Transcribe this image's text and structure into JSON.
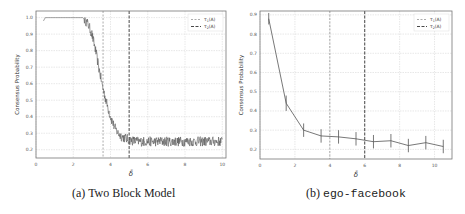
{
  "chart_data": [
    {
      "type": "line",
      "panel": "a",
      "caption_prefix": "(a)",
      "caption": "Two Block Model",
      "xlabel": "δ̄",
      "ylabel": "Consensus Probability",
      "xlim": [
        0,
        10.2
      ],
      "ylim": [
        0.15,
        1.04
      ],
      "xticks": [
        0,
        2,
        4,
        6,
        8,
        10
      ],
      "yticks": [
        0.2,
        0.3,
        0.4,
        0.5,
        0.6,
        0.7,
        0.8,
        0.9,
        1.0
      ],
      "grid": true,
      "legend": {
        "position": "upper right",
        "entries": [
          "τ1(A)",
          "τ2(A)"
        ]
      },
      "vlines": [
        {
          "name": "τ1(A)",
          "x": 3.6,
          "style": "dashed-light"
        },
        {
          "name": "τ2(A)",
          "x": 5.0,
          "style": "dashed-dark"
        }
      ],
      "series": [
        {
          "name": "consensus probability",
          "x": [
            0.4,
            0.5,
            0.6,
            1.0,
            1.5,
            2.0,
            2.5,
            2.6,
            2.8,
            3.0,
            3.2,
            3.4,
            3.6,
            3.8,
            4.0,
            4.2,
            4.4,
            4.6,
            4.8,
            5.0,
            5.2,
            5.5,
            6.0,
            6.5,
            7.0,
            7.5,
            8.0,
            8.5,
            9.0,
            9.5,
            10.0
          ],
          "values": [
            0.98,
            1.0,
            1.0,
            1.0,
            1.0,
            1.0,
            1.0,
            0.99,
            0.96,
            0.9,
            0.8,
            0.68,
            0.57,
            0.48,
            0.4,
            0.34,
            0.3,
            0.28,
            0.27,
            0.26,
            0.255,
            0.25,
            0.25,
            0.25,
            0.25,
            0.25,
            0.25,
            0.25,
            0.25,
            0.25,
            0.25
          ],
          "noise": "high-frequency fluctuation ±0.03 after x≈2.6"
        }
      ]
    },
    {
      "type": "line",
      "panel": "b",
      "caption_prefix": "(b)",
      "caption": "ego-facebook",
      "xlabel": "δ̄",
      "ylabel": "Consensus Probability",
      "xlim": [
        0,
        11
      ],
      "ylim": [
        0.15,
        0.92
      ],
      "xticks": [
        0,
        2,
        4,
        6,
        8,
        10
      ],
      "yticks": [
        0.2,
        0.3,
        0.4,
        0.5,
        0.6,
        0.7,
        0.8,
        0.9
      ],
      "grid": true,
      "legend": {
        "position": "upper right",
        "entries": [
          "τ1(A)",
          "τ2(A)"
        ]
      },
      "vlines": [
        {
          "name": "τ1(A)",
          "x": 4.0,
          "style": "dashed-light"
        },
        {
          "name": "τ2(A)",
          "x": 6.0,
          "style": "dashed-dark"
        }
      ],
      "series": [
        {
          "name": "consensus probability",
          "x": [
            0.5,
            1.5,
            2.5,
            3.5,
            4.5,
            5.5,
            6.5,
            7.5,
            8.5,
            9.5,
            10.5
          ],
          "values": [
            0.88,
            0.44,
            0.3,
            0.27,
            0.265,
            0.255,
            0.24,
            0.245,
            0.22,
            0.235,
            0.215
          ],
          "error": [
            0.03,
            0.04,
            0.035,
            0.035,
            0.035,
            0.035,
            0.035,
            0.035,
            0.035,
            0.035,
            0.035
          ]
        }
      ]
    }
  ]
}
